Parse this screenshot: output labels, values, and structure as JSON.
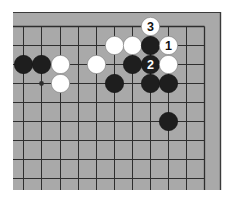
{
  "diagram": {
    "type": "go-board-fragment",
    "corner": "top-right",
    "colors": {
      "board": "#a9a9a9",
      "frame": "#3a3a3a",
      "grid": "#2e2e2e",
      "black_stone": "#1e1e1e",
      "white_stone": "#ffffff",
      "page": "#ffffff"
    },
    "grid": {
      "columns_x": [
        23,
        41,
        60,
        78,
        96,
        114,
        132,
        150,
        168,
        186,
        204
      ],
      "rows_y": [
        26,
        45,
        64,
        83,
        102,
        121,
        140,
        159,
        178
      ]
    },
    "star_points": [
      {
        "col": 1,
        "row": 3
      }
    ],
    "stones": [
      {
        "color": "black",
        "col": 0,
        "row": 2,
        "label": ""
      },
      {
        "color": "black",
        "col": 1,
        "row": 2,
        "label": ""
      },
      {
        "color": "white",
        "col": 2,
        "row": 2,
        "label": ""
      },
      {
        "color": "white",
        "col": 2,
        "row": 3,
        "label": ""
      },
      {
        "color": "white",
        "col": 4,
        "row": 2,
        "label": ""
      },
      {
        "color": "white",
        "col": 5,
        "row": 1,
        "label": ""
      },
      {
        "color": "white",
        "col": 6,
        "row": 1,
        "label": ""
      },
      {
        "color": "black",
        "col": 7,
        "row": 1,
        "label": ""
      },
      {
        "color": "white",
        "col": 8,
        "row": 1,
        "label": "1"
      },
      {
        "color": "black",
        "col": 7,
        "row": 2,
        "label": "2"
      },
      {
        "color": "white",
        "col": 7,
        "row": 0,
        "label": "3"
      },
      {
        "color": "black",
        "col": 6,
        "row": 2,
        "label": ""
      },
      {
        "color": "white",
        "col": 8,
        "row": 2,
        "label": ""
      },
      {
        "color": "black",
        "col": 5,
        "row": 3,
        "label": ""
      },
      {
        "color": "black",
        "col": 7,
        "row": 3,
        "label": ""
      },
      {
        "color": "black",
        "col": 8,
        "row": 3,
        "label": ""
      },
      {
        "color": "black",
        "col": 8,
        "row": 5,
        "label": ""
      }
    ],
    "move_labels": [
      "1",
      "2",
      "3"
    ]
  }
}
